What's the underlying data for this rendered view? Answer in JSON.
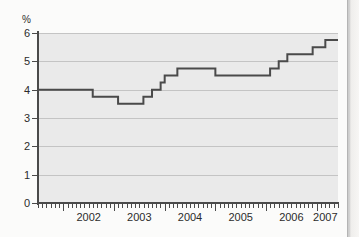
{
  "chart_data": {
    "type": "line",
    "line_style": "step-post",
    "title": "",
    "subtitle": "",
    "xlabel": "",
    "ylabel": "%",
    "unit_label": "%",
    "ylim": [
      0,
      6
    ],
    "yticks": [
      0,
      1,
      2,
      3,
      4,
      5,
      6
    ],
    "ytick_labels": [
      "0",
      "1",
      "2",
      "3",
      "4",
      "5",
      "6"
    ],
    "xlim": [
      2001.5,
      2007.42
    ],
    "xtick_labels": [
      "2002",
      "2003",
      "2004",
      "2005",
      "2006",
      "2007"
    ],
    "xtick_values": [
      2002,
      2003,
      2004,
      2005,
      2006,
      2007
    ],
    "xtick_label_positions": [
      2002.5,
      2003.5,
      2004.5,
      2005.5,
      2006.5,
      2007.17
    ],
    "minor_tick_interval_months": 1,
    "grid": true,
    "grid_axis": "y",
    "legend": false,
    "legend_position": "none",
    "series": [
      {
        "name": "Interest rate",
        "color": "#4a4a4a",
        "line_width": 2,
        "x": [
          2001.5,
          2002.58,
          2003.08,
          2003.33,
          2003.58,
          2003.75,
          2003.92,
          2004.0,
          2004.08,
          2004.25,
          2005.0,
          2006.08,
          2006.25,
          2006.42,
          2006.67,
          2006.92,
          2007.17,
          2007.42
        ],
        "values": [
          4.0,
          3.75,
          3.5,
          3.5,
          3.75,
          4.0,
          4.25,
          4.5,
          4.5,
          4.75,
          4.5,
          4.75,
          5.0,
          5.25,
          5.25,
          5.5,
          5.75,
          5.75
        ]
      }
    ],
    "annotations": [],
    "colors": {
      "line": "#4a4a4a",
      "plot_background": "#eaeaea",
      "gridline": "#c4c4c4",
      "axis": "#4a4a4a",
      "page_background": "#fbfbfa",
      "text": "#2b2b2b"
    }
  }
}
